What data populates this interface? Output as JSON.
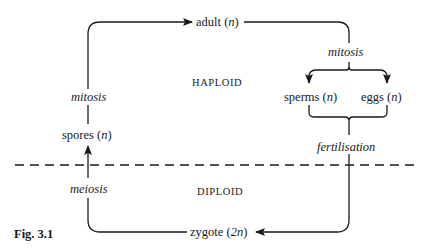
{
  "figure": {
    "caption": "Fig. 3.1",
    "regions": {
      "haploid": "HAPLOID",
      "diploid": "DIPLOID"
    },
    "nodes": {
      "adult": {
        "name": "adult",
        "ploidy": "n"
      },
      "sperms": {
        "name": "sperms",
        "ploidy": "n"
      },
      "eggs": {
        "name": "eggs",
        "ploidy": "n"
      },
      "zygote": {
        "name": "zygote",
        "ploidy": "2n"
      },
      "spores": {
        "name": "spores",
        "ploidy": "n"
      }
    },
    "processes": {
      "mitosis_left": "mitosis",
      "mitosis_right": "mitosis",
      "fertilisation": "fertilisation",
      "meiosis": "meiosis"
    },
    "edges": [
      {
        "from": "spores",
        "to": "adult",
        "process": "mitosis"
      },
      {
        "from": "adult",
        "to": "sperms",
        "process": "mitosis"
      },
      {
        "from": "adult",
        "to": "eggs",
        "process": "mitosis"
      },
      {
        "from": "sperms",
        "to": "zygote",
        "process": "fertilisation"
      },
      {
        "from": "eggs",
        "to": "zygote",
        "process": "fertilisation"
      },
      {
        "from": "zygote",
        "to": "spores",
        "process": "meiosis"
      }
    ],
    "colors": {
      "ink": "#1a1a1a",
      "background": "#ffffff"
    }
  }
}
